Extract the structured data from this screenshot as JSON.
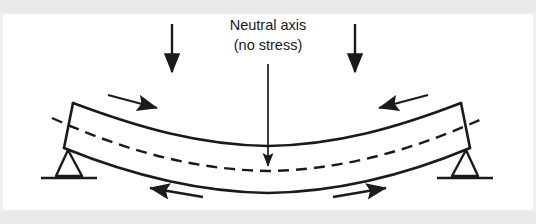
{
  "figure": {
    "title_line_1": "Neutral axis",
    "title_line_2": "(no stress)",
    "ink_color": "#1a1a1a",
    "background_color": "#ffffff",
    "band_color": "#e9e9e9"
  },
  "annotations": {
    "neutral_axis_label": "Neutral axis",
    "neutral_axis_sublabel": "(no stress)"
  },
  "elements": {
    "beam_name": "bent-beam",
    "neutral_axis_name": "neutral-axis-dashed-line",
    "leader_name": "neutral-axis-leader-arrow",
    "load_left_name": "load-arrow-left",
    "load_right_name": "load-arrow-right",
    "support_left_name": "pin-support-left",
    "support_right_name": "pin-support-right",
    "compression_left_name": "compression-arrow-left",
    "compression_right_name": "compression-arrow-right",
    "tension_left_name": "tension-arrow-left",
    "tension_right_name": "tension-arrow-right"
  },
  "diagram_data": {
    "type": "engineering-diagram",
    "subject": "beam bending under two point loads",
    "beam_span_px": [
      65,
      466
    ],
    "beam_midspan_sag_px": 30,
    "load_positions_px": [
      172,
      355
    ],
    "load_direction": "downward",
    "top_fiber_state": "compression",
    "bottom_fiber_state": "tension",
    "neutral_axis_state": "no stress",
    "support_type": "pin",
    "support_count": 2
  }
}
